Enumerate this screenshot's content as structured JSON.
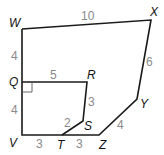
{
  "diagram": {
    "outer_polygon": [
      "W",
      "X",
      "Y",
      "Z",
      "V"
    ],
    "inner_polygon": [
      "Q",
      "R",
      "S",
      "T",
      "V"
    ],
    "vertices": {
      "W": {
        "label": "W",
        "x": 22,
        "y": 29
      },
      "X": {
        "label": "X",
        "x": 151,
        "y": 20
      },
      "Y": {
        "label": "Y",
        "x": 137,
        "y": 99
      },
      "Z": {
        "label": "Z",
        "x": 99,
        "y": 135
      },
      "T": {
        "label": "T",
        "x": 62,
        "y": 135
      },
      "S": {
        "label": "S",
        "x": 83,
        "y": 121
      },
      "R": {
        "label": "R",
        "x": 87,
        "y": 82
      },
      "Q": {
        "label": "Q",
        "x": 22,
        "y": 82
      },
      "V": {
        "label": "V",
        "x": 22,
        "y": 135
      }
    },
    "side_lengths": {
      "WX": "10",
      "XY": "6",
      "YZ": "4",
      "TZ": "3",
      "VT": "3",
      "ST": "2",
      "RS": "3",
      "QR": "5",
      "WQ": "4",
      "QV": "4"
    },
    "right_angle_at": "Q"
  }
}
